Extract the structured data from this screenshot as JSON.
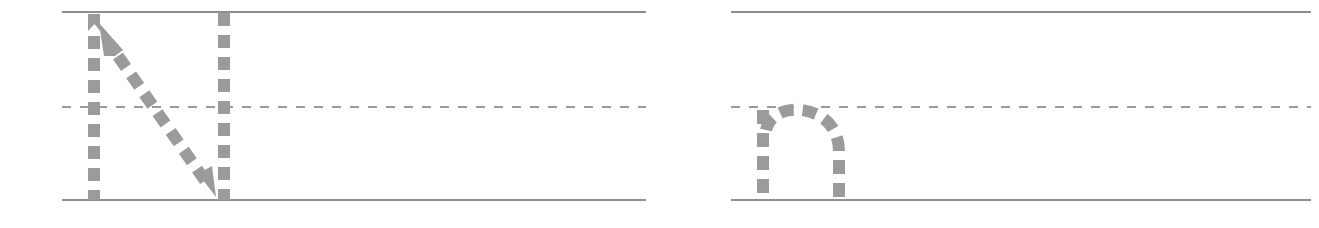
{
  "worksheet": {
    "title": "Letter tracing practice row",
    "kind": "handwriting-tracing-worksheet",
    "canvas": {
      "width": 1319,
      "height": 228
    },
    "colors": {
      "rule_line": "#8f8f8f",
      "midline_dashed": "#9a9a9a",
      "trace_stroke": "#9b9b9b",
      "page_background": "#ffffff"
    },
    "guide_lines": {
      "top_line_y": 12,
      "midline_y": 107,
      "baseline_y": 200,
      "rule_thickness": 2,
      "midline_dash_pattern": "9 9",
      "groups": [
        {
          "name": "group-left",
          "x_start": 62,
          "x_end": 646
        },
        {
          "name": "group-right",
          "x_start": 731,
          "x_end": 1311
        }
      ]
    },
    "letters": [
      {
        "id": "uppercase-n",
        "character": "N",
        "case": "uppercase",
        "group": "group-left",
        "x_start": 88,
        "x_end": 231,
        "top_y": 12,
        "bottom_y": 200,
        "strokes": [
          {
            "order": 1,
            "name": "left-vertical-downstroke",
            "direction": "top-to-bottom",
            "has_start_arrow": true,
            "arrow_points": "up",
            "from": [
              94,
              12
            ],
            "to": [
              94,
              200
            ]
          },
          {
            "order": 2,
            "name": "diagonal-downstroke",
            "direction": "upper-left-to-lower-right",
            "has_start_arrow": true,
            "arrow_points": "up-left",
            "from": [
              99,
              22
            ],
            "to": [
              216,
              197
            ]
          },
          {
            "order": 3,
            "name": "right-vertical-downstroke",
            "direction": "top-to-bottom",
            "has_start_arrow": false,
            "from": [
              224,
              12
            ],
            "to": [
              224,
              200
            ]
          }
        ]
      },
      {
        "id": "lowercase-n",
        "character": "n",
        "case": "lowercase",
        "group": "group-right",
        "x_start": 757,
        "x_end": 846,
        "top_y": 107,
        "bottom_y": 200,
        "strokes": [
          {
            "order": 1,
            "name": "left-vertical-downstroke",
            "direction": "top-to-bottom",
            "has_start_arrow": false,
            "from": [
              763,
              109
            ],
            "to": [
              763,
              200
            ]
          },
          {
            "order": 2,
            "name": "arch-and-right-leg",
            "direction": "up-over-and-down",
            "has_start_arrow": false,
            "from": [
              763,
              135
            ],
            "to": [
              839,
              200
            ]
          }
        ]
      }
    ],
    "dash": {
      "segment_length": 13,
      "gap_length": 9,
      "stroke_width": 12
    }
  }
}
